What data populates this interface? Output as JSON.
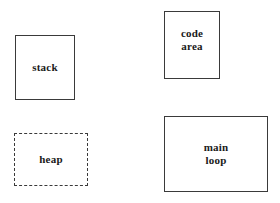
{
  "diagram": {
    "type": "memory-layout-block-diagram",
    "background_color": "#ffffff",
    "border_color": "#3a3a3a",
    "text_color": "#1a1a1a",
    "boxes": [
      {
        "id": "stack",
        "label": "stack",
        "border_style": "solid",
        "x": 15,
        "y": 35,
        "width": 60,
        "height": 65
      },
      {
        "id": "heap",
        "label": "heap",
        "border_style": "dashed",
        "x": 14,
        "y": 133,
        "width": 74,
        "height": 53
      },
      {
        "id": "code-area",
        "label": "code\narea",
        "border_style": "solid",
        "x": 164,
        "y": 11,
        "width": 56,
        "height": 68
      },
      {
        "id": "main-loop",
        "label": "main\nloop",
        "border_style": "solid",
        "x": 164,
        "y": 116,
        "width": 104,
        "height": 76
      }
    ]
  }
}
